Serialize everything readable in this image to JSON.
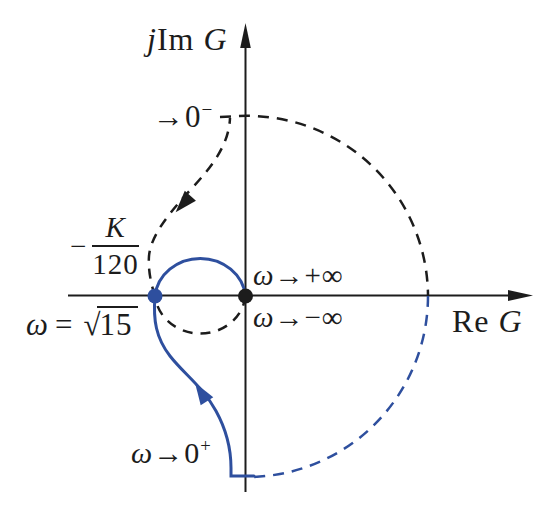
{
  "colors": {
    "ink": "#1c1c1c",
    "blue": "#2e4f9e",
    "background": "#ffffff"
  },
  "y_axis": {
    "j": "j",
    "im": "Im",
    "g": "G"
  },
  "x_axis": {
    "re": "Re",
    "g": "G"
  },
  "labels": {
    "to_zero_minus": {
      "arrow": "→",
      "zero": "0",
      "sup": "−"
    },
    "gain": {
      "minus": "−",
      "num": "K",
      "den": "120"
    },
    "sqrt15": {
      "omega": "ω",
      "eq": "=",
      "root": "√",
      "radicand": "15"
    },
    "to_plus_inf": {
      "omega": "ω",
      "arrow": "→",
      "val": "+∞"
    },
    "to_minus_inf": {
      "omega": "ω",
      "arrow": "→",
      "val": "−∞"
    },
    "to_zero_plus": {
      "omega": "ω",
      "arrow": "→",
      "zero": "0",
      "sup": "+"
    }
  }
}
